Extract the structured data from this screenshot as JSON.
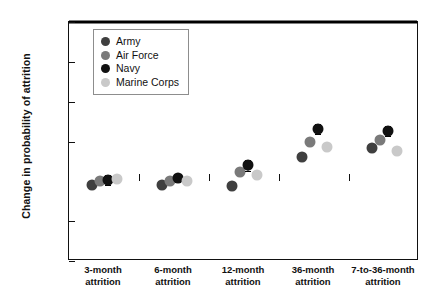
{
  "chart_data": {
    "type": "scatter",
    "title": "",
    "xlabel": "",
    "ylabel": "Change in probability of attrition",
    "ylim": [
      -0.1,
      0.2
    ],
    "yticks": [
      0.2,
      0.15,
      0.1,
      0.05,
      0,
      -0.05,
      -0.1
    ],
    "ytick_labels": [
      "0.20",
      "0.15",
      "0.10",
      "0.05",
      "0",
      "−0.05",
      "−0.10"
    ],
    "grid": false,
    "legend_position": "upper-left",
    "zero_line": true,
    "categories": [
      "3-month\nattrition",
      "6-month\nattrition",
      "12-month\nattrition",
      "36-month\nattrition",
      "7-to-36-month\nattrition"
    ],
    "category_lines": [
      [
        "3-month",
        "attrition"
      ],
      [
        "6-month",
        "attrition"
      ],
      [
        "12-month",
        "attrition"
      ],
      [
        "36-month",
        "attrition"
      ],
      [
        "7-to-36-month",
        "attrition"
      ]
    ],
    "series": [
      {
        "name": "Army",
        "color": "#3f3f3f",
        "values": [
          -0.004,
          -0.005,
          -0.006,
          0.031,
          0.042
        ],
        "errors": [
          0,
          0,
          0,
          0,
          0
        ]
      },
      {
        "name": "Air Force",
        "color": "#7a7a7a",
        "values": [
          0.0,
          0.001,
          0.012,
          0.05,
          0.052
        ],
        "errors": [
          0,
          0,
          0,
          0,
          0
        ]
      },
      {
        "name": "Navy",
        "color": "#111111",
        "values": [
          0.002,
          0.004,
          0.02,
          0.066,
          0.063
        ],
        "errors": [
          0.006,
          0.005,
          0.007,
          0.006,
          0.006
        ]
      },
      {
        "name": "Marine Corps",
        "color": "#c9c9c9",
        "values": [
          0.003,
          0.001,
          0.008,
          0.043,
          0.038
        ],
        "errors": [
          0,
          0,
          0,
          0,
          0
        ]
      }
    ]
  },
  "legend": {
    "items": [
      {
        "label": "Army",
        "color": "#3f3f3f"
      },
      {
        "label": "Air Force",
        "color": "#7a7a7a"
      },
      {
        "label": "Navy",
        "color": "#111111"
      },
      {
        "label": "Marine Corps",
        "color": "#c9c9c9"
      }
    ]
  },
  "axes": {
    "y_title": "Change in probability of attrition"
  }
}
